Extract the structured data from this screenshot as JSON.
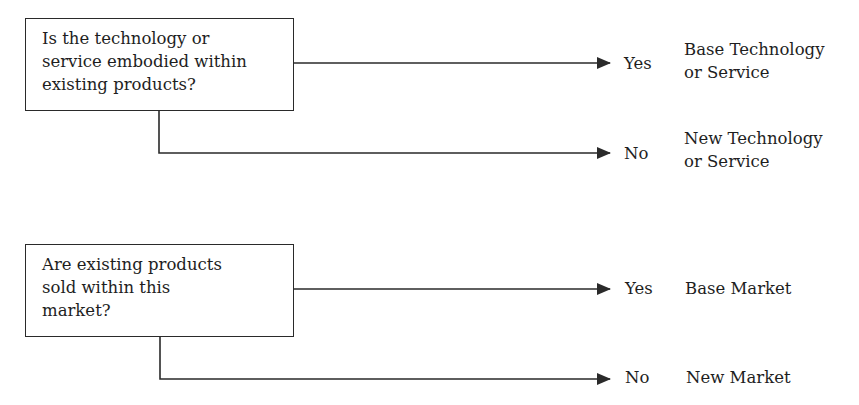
{
  "diagram": {
    "questions": [
      {
        "lines": [
          "Is the technology or",
          "service embodied within",
          "existing products?"
        ],
        "branches": [
          {
            "answer": "Yes",
            "result_lines": [
              "Base Technology",
              "or Service"
            ]
          },
          {
            "answer": "No",
            "result_lines": [
              "New Technology",
              "or Service"
            ]
          }
        ]
      },
      {
        "lines": [
          "Are existing products",
          "sold within this",
          "market?"
        ],
        "branches": [
          {
            "answer": "Yes",
            "result_lines": [
              "Base Market"
            ]
          },
          {
            "answer": "No",
            "result_lines": [
              "New Market"
            ]
          }
        ]
      }
    ],
    "colors": {
      "line": "#2a2a2a",
      "text": "#1e1e1e",
      "background": "#ffffff"
    }
  }
}
